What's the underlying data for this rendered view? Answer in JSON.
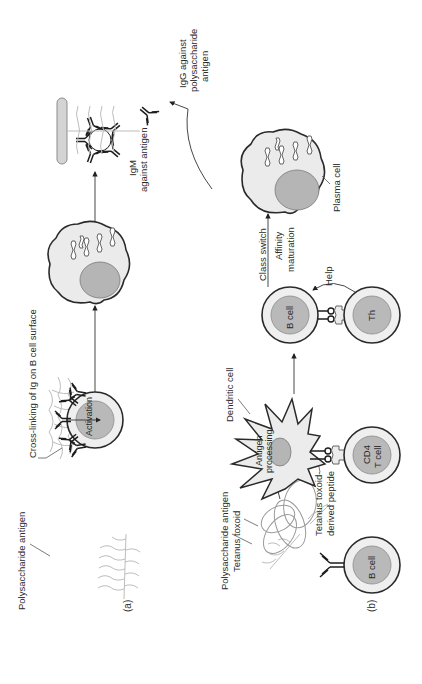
{
  "figure": {
    "orientation": "rotated 90 degrees counter-clockwise",
    "panels": [
      {
        "id": "a",
        "label": "(a)",
        "labels": {
          "polysaccharide_antigen": "Polysaccharide antigen",
          "cross_linking": "Cross-linking of Ig on B cell surface",
          "activation": "Activation",
          "igm_line1": "IgM",
          "igm_line2": "against antigen"
        }
      },
      {
        "id": "b",
        "label": "(b)",
        "labels": {
          "polysaccharide_antigen": "Polysaccharide antigen",
          "tetanus_toxoid": "Tetanus toxoid",
          "dendritic_cell": "Dendritic cell",
          "antigen_processing_line1": "Antigen",
          "antigen_processing_line2": "processing",
          "tetanus_peptide_line1": "Tetanus toxoid-",
          "tetanus_peptide_line2": "derived peptide",
          "b_cell_bottom": "B cell",
          "cd4_line1": "CD4",
          "cd4_line2": "T cell",
          "b_cell_top": "B cell",
          "th": "Th",
          "help": "Help",
          "class_switch": "Class switch",
          "affinity_line1": "Affinity",
          "affinity_line2": "maturation",
          "plasma_cell": "Plasma cell",
          "igg_line1": "IgG against",
          "igg_line2": "polysaccharide",
          "igg_line3": "antigen"
        }
      }
    ]
  }
}
